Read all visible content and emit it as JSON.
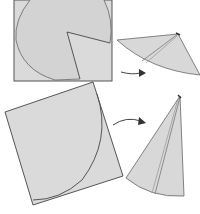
{
  "diagram": {
    "colors": {
      "paper": "#d9d9d9",
      "paper_shade": "#cccccc",
      "edge": "#555555",
      "background": "#ffffff"
    },
    "steps": [
      {
        "id": "step-1",
        "shape": "square with circle and wedge cut",
        "result": "shallow cone"
      },
      {
        "id": "step-2",
        "shape": "rotated square with quarter-circle arc",
        "result": "tall cone"
      }
    ]
  }
}
